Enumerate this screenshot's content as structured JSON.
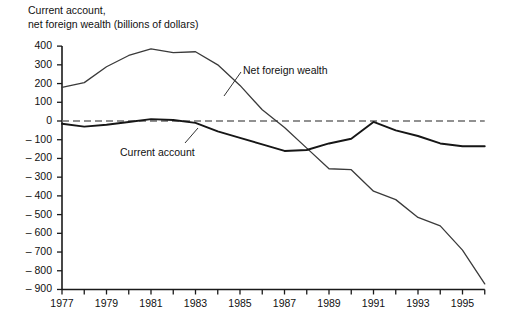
{
  "chart_data": {
    "type": "line",
    "title_line1": "Current account,",
    "title_line2": "net foreign wealth (billions of dollars)",
    "xlabel": "",
    "ylabel": "",
    "xlim": [
      1977,
      1996
    ],
    "ylim": [
      -900,
      400
    ],
    "grid": false,
    "legend_position": "inline-annotation",
    "zero_line": true,
    "zero_line_style": "dashed",
    "y_ticks": [
      400,
      300,
      200,
      100,
      0,
      -100,
      -200,
      -300,
      -400,
      -500,
      -600,
      -700,
      -800,
      -900
    ],
    "y_tick_labels": [
      "400",
      "300",
      "200",
      "100",
      "0",
      "– 100",
      "– 200",
      "– 300",
      "– 400",
      "– 500",
      "– 600",
      "– 700",
      "– 800",
      "– 900"
    ],
    "x_ticks": [
      1977,
      1978,
      1979,
      1980,
      1981,
      1982,
      1983,
      1984,
      1985,
      1986,
      1987,
      1988,
      1989,
      1990,
      1991,
      1992,
      1993,
      1994,
      1995,
      1996
    ],
    "x_tick_labels": [
      "1977",
      "",
      "1979",
      "",
      "1981",
      "",
      "1983",
      "",
      "1985",
      "",
      "1987",
      "",
      "1989",
      "",
      "1991",
      "",
      "1993",
      "",
      "1995",
      ""
    ],
    "x": [
      1977,
      1978,
      1979,
      1980,
      1981,
      1982,
      1983,
      1984,
      1985,
      1986,
      1987,
      1988,
      1989,
      1990,
      1991,
      1992,
      1993,
      1994,
      1995,
      1996
    ],
    "series": [
      {
        "name": "Net foreign wealth",
        "color": "#3a3a3a",
        "width": 1.3,
        "label_text": "Net foreign wealth",
        "values": [
          180,
          205,
          290,
          350,
          385,
          365,
          370,
          300,
          190,
          60,
          -35,
          -145,
          -255,
          -260,
          -375,
          -420,
          -515,
          -560,
          -690,
          -870
        ]
      },
      {
        "name": "Current account",
        "color": "#161616",
        "width": 1.9,
        "label_text": "Current account",
        "values": [
          -15,
          -30,
          -20,
          -5,
          10,
          5,
          -10,
          -55,
          -90,
          -125,
          -160,
          -155,
          -120,
          -95,
          -5,
          -50,
          -80,
          -120,
          -135,
          -135
        ]
      }
    ],
    "annotations": [
      {
        "text": "Net foreign wealth",
        "x_px": 243,
        "y_px": 64
      },
      {
        "text": "Current account",
        "x_px": 120,
        "y_px": 146
      }
    ]
  }
}
